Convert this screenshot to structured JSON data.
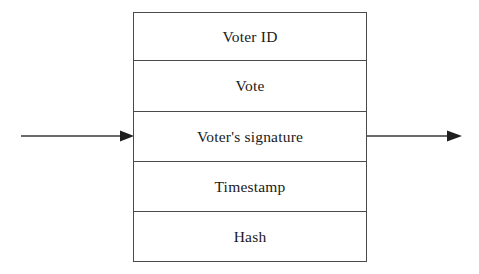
{
  "diagram": {
    "type": "block-record",
    "stroke_color": "#4a4a4a",
    "text_color": "#1a1a1a",
    "background_color": "#ffffff",
    "block": {
      "name": "vote-block",
      "fields": [
        {
          "id": "voter-id",
          "label": "Voter ID"
        },
        {
          "id": "vote",
          "label": "Vote"
        },
        {
          "id": "signature",
          "label": "Voter's signature"
        },
        {
          "id": "timestamp",
          "label": "Timestamp"
        },
        {
          "id": "hash",
          "label": "Hash"
        }
      ]
    },
    "connectors": [
      {
        "id": "input-arrow",
        "direction": "right",
        "label": ""
      },
      {
        "id": "output-arrow",
        "direction": "right",
        "label": ""
      }
    ]
  }
}
